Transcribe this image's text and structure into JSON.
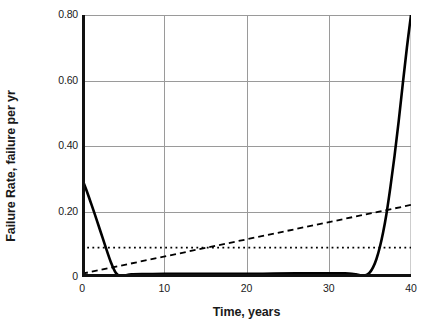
{
  "chart_data": {
    "type": "line",
    "title": "",
    "xlabel": "Time, years",
    "ylabel": "Failure Rate, failure per yr",
    "xlim": [
      0,
      40
    ],
    "ylim": [
      0,
      0.8
    ],
    "grid": true,
    "legend": null,
    "xticks": [
      "0",
      "10",
      "20",
      "30",
      "40"
    ],
    "xtick_values": [
      0,
      10,
      20,
      30,
      40
    ],
    "yticks": [
      "0",
      "0.20",
      "0.40",
      "0.60",
      "0.80"
    ],
    "ytick_values": [
      0,
      0.2,
      0.4,
      0.6,
      0.8
    ],
    "series": [
      {
        "name": "bathtub-curve",
        "style": "solid",
        "color": "#000000",
        "width": 2.6,
        "x": [
          0,
          0.5,
          1,
          1.5,
          2,
          2.5,
          3,
          3.5,
          4,
          4.3,
          4.6,
          5,
          5.5,
          6,
          8,
          10,
          14,
          18,
          22,
          26,
          29,
          31,
          32,
          32.8,
          33.3,
          33.8,
          34.2,
          34.6,
          35,
          35.4,
          35.8,
          36.2,
          36.6,
          37,
          37.5,
          38,
          38.5,
          39,
          39.5,
          40
        ],
        "y": [
          0.3,
          0.268,
          0.232,
          0.196,
          0.158,
          0.12,
          0.082,
          0.046,
          0.017,
          0.008,
          0.004,
          0.004,
          0.006,
          0.008,
          0.009,
          0.01,
          0.01,
          0.01,
          0.01,
          0.011,
          0.011,
          0.011,
          0.011,
          0.01,
          0.008,
          0.005,
          0.004,
          0.006,
          0.014,
          0.03,
          0.055,
          0.09,
          0.135,
          0.19,
          0.275,
          0.37,
          0.475,
          0.59,
          0.7,
          0.8
        ]
      },
      {
        "name": "increasing-wearout-trend",
        "style": "dashed",
        "color": "#000000",
        "width": 1.8,
        "x": [
          0,
          40
        ],
        "y": [
          0.01,
          0.22
        ]
      },
      {
        "name": "constant-random-failure-rate",
        "style": "dotted",
        "color": "#000000",
        "width": 1.8,
        "x": [
          0,
          40
        ],
        "y": [
          0.09,
          0.09
        ]
      }
    ]
  },
  "axes": {
    "ylabel_text": "Failure Rate, failure per yr",
    "xlabel_text": "Time, years"
  }
}
